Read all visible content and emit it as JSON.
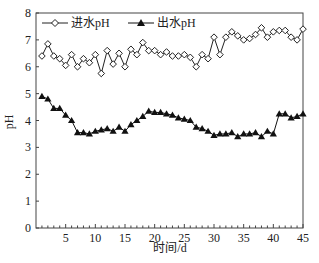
{
  "chart_data": {
    "type": "line",
    "title": "",
    "xlabel": "时间/d",
    "ylabel": "pH",
    "xlim": [
      0,
      45
    ],
    "ylim": [
      0,
      8
    ],
    "xticks": [
      5,
      10,
      15,
      20,
      25,
      30,
      35,
      40,
      45
    ],
    "yticks": [
      0,
      1,
      2,
      3,
      4,
      5,
      6,
      7,
      8
    ],
    "grid": false,
    "legend_position": "top-left, inside",
    "x": [
      1,
      2,
      3,
      4,
      5,
      6,
      7,
      8,
      9,
      10,
      11,
      12,
      13,
      14,
      15,
      16,
      17,
      18,
      19,
      20,
      21,
      22,
      23,
      24,
      25,
      26,
      27,
      28,
      29,
      30,
      31,
      32,
      33,
      34,
      35,
      36,
      37,
      38,
      39,
      40,
      41,
      42,
      43,
      44,
      45
    ],
    "series": [
      {
        "name": "进水pH",
        "marker": "open-diamond",
        "color": "#222222",
        "values": [
          6.4,
          6.85,
          6.4,
          6.3,
          6.05,
          6.45,
          6.0,
          6.3,
          6.15,
          6.45,
          5.75,
          6.6,
          6.1,
          6.5,
          6.0,
          6.65,
          6.45,
          6.9,
          6.6,
          6.6,
          6.45,
          6.55,
          6.4,
          6.4,
          6.45,
          6.35,
          6.0,
          6.45,
          6.3,
          7.1,
          6.45,
          7.1,
          7.3,
          7.15,
          7.0,
          7.05,
          7.2,
          7.45,
          7.1,
          7.3,
          7.35,
          7.35,
          7.1,
          7.0,
          7.4
        ]
      },
      {
        "name": "出水pH",
        "marker": "filled-triangle",
        "color": "#111111",
        "values": [
          4.9,
          4.8,
          4.45,
          4.45,
          4.2,
          4.0,
          3.55,
          3.55,
          3.5,
          3.6,
          3.65,
          3.7,
          3.6,
          3.75,
          3.6,
          3.85,
          4.0,
          4.15,
          4.35,
          4.3,
          4.3,
          4.25,
          4.2,
          4.1,
          4.05,
          4.0,
          3.75,
          3.7,
          3.6,
          3.45,
          3.5,
          3.5,
          3.55,
          3.4,
          3.5,
          3.5,
          3.55,
          3.4,
          3.6,
          3.5,
          4.25,
          4.25,
          4.1,
          4.15,
          4.25
        ]
      }
    ]
  }
}
